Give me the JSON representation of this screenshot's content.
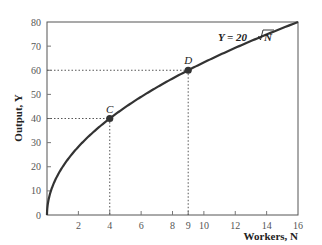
{
  "chart_data": {
    "type": "line",
    "title": "",
    "xlabel": "Workers, N",
    "ylabel": "Output, Y",
    "xlim": [
      0,
      16
    ],
    "ylim": [
      0,
      80
    ],
    "x_ticks": [
      2,
      4,
      6,
      8,
      9,
      10,
      12,
      14,
      16
    ],
    "y_ticks": [
      0,
      10,
      20,
      30,
      40,
      50,
      60,
      70,
      80
    ],
    "series": [
      {
        "name": "Y = 20√N",
        "function": "20*sqrt(N)",
        "x": [
          0,
          1,
          2,
          4,
          6,
          8,
          9,
          10,
          12,
          14,
          16
        ],
        "values": [
          0,
          20,
          28.3,
          40,
          49,
          56.6,
          60,
          63.2,
          69.3,
          74.8,
          80
        ]
      }
    ],
    "points": [
      {
        "label": "C",
        "x": 4,
        "y": 40
      },
      {
        "label": "D",
        "x": 9,
        "y": 60
      }
    ],
    "annotations": [
      "Y = 20√N"
    ],
    "grid": false,
    "legend": null
  },
  "labels": {
    "xlabel": "Workers, N",
    "ylabel": "Output, Y",
    "equation_prefix": "Y = 20",
    "equation_var": "N",
    "point_c": "C",
    "point_d": "D"
  }
}
